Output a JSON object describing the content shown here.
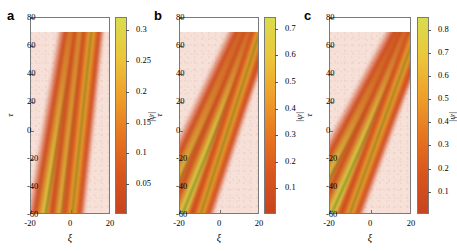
{
  "figure": {
    "background": "#ffffff",
    "plot_background": "#f6e0d8",
    "axis_color": "#7a7a7a"
  },
  "chart_data": [
    {
      "type": "heatmap",
      "panel": "a",
      "title": "",
      "xlabel": "ξ",
      "ylabel": "τ",
      "zlabel": "|ψ|",
      "xlim": [
        -20,
        20
      ],
      "ylim": [
        -60,
        80
      ],
      "xticks": [
        -20,
        0,
        20
      ],
      "yticks": [
        -60,
        -40,
        -20,
        0,
        20,
        40,
        60,
        80
      ],
      "xtick_labels": [
        "-20",
        "0",
        "20"
      ],
      "ytick_labels": [
        "-60",
        "-40",
        "-20",
        "0",
        "20",
        "40",
        "60",
        "80"
      ],
      "data_tau_max": 70,
      "zlim": [
        0.0,
        0.32
      ],
      "colorbar_ticks": [
        0.05,
        0.1,
        0.15,
        0.2,
        0.25,
        0.3
      ],
      "colorbar_tick_labels": [
        "0.05",
        "0.1",
        "0.15",
        "0.2",
        "0.25",
        "0.3"
      ],
      "grid": false,
      "legend": "none",
      "colormap": [
        "#c8441f",
        "#d9551d",
        "#e8761f",
        "#efa02a",
        "#ecc63a",
        "#d9dc4e"
      ],
      "soliton_tracks": [
        {
          "name": "track-1",
          "xi_at_tau0": -4.5,
          "slope_deg": 9.5,
          "width": 10,
          "peak": 0.3
        },
        {
          "name": "track-2",
          "xi_at_tau0": 1.5,
          "slope_deg": 7.0,
          "width": 9,
          "peak": 0.3
        },
        {
          "name": "track-3",
          "xi_at_tau0": 5.5,
          "slope_deg": 6.0,
          "width": 7,
          "peak": 0.22
        }
      ]
    },
    {
      "type": "heatmap",
      "panel": "b",
      "title": "",
      "xlabel": "ξ",
      "ylabel": "τ",
      "zlabel": "|ψ|",
      "xlim": [
        -20,
        20
      ],
      "ylim": [
        -60,
        80
      ],
      "xticks": [
        -20,
        0,
        20
      ],
      "yticks": [
        -60,
        -40,
        -20,
        0,
        20,
        40,
        60,
        80
      ],
      "xtick_labels": [
        "-20",
        "0",
        "20"
      ],
      "ytick_labels": [
        "-60",
        "-40",
        "-20",
        "0",
        "20",
        "40",
        "60",
        "80"
      ],
      "data_tau_max": 70,
      "zlim": [
        0.0,
        0.74
      ],
      "colorbar_ticks": [
        0.1,
        0.2,
        0.3,
        0.4,
        0.5,
        0.6,
        0.7
      ],
      "colorbar_tick_labels": [
        "0.1",
        "0.2",
        "0.3",
        "0.4",
        "0.5",
        "0.6",
        "0.7"
      ],
      "grid": false,
      "legend": "none",
      "colormap": [
        "#c8441f",
        "#d9551d",
        "#e8761f",
        "#efa02a",
        "#ecc63a",
        "#d9dc4e"
      ],
      "soliton_tracks": [
        {
          "name": "track-1",
          "xi_at_tau0": -5.0,
          "slope_deg": 25.0,
          "width": 11,
          "peak": 0.72
        },
        {
          "name": "track-2",
          "xi_at_tau0": 1.0,
          "slope_deg": 22.0,
          "width": 10,
          "peak": 0.72
        },
        {
          "name": "track-3",
          "xi_at_tau0": 6.0,
          "slope_deg": 18.0,
          "width": 7,
          "peak": 0.5
        }
      ]
    },
    {
      "type": "heatmap",
      "panel": "c",
      "title": "",
      "xlabel": "ξ",
      "ylabel": "τ",
      "zlabel": "|ψ|",
      "xlim": [
        -20,
        20
      ],
      "ylim": [
        -60,
        80
      ],
      "xticks": [
        -20,
        0,
        20
      ],
      "yticks": [
        -60,
        -40,
        -20,
        0,
        20,
        40,
        60,
        80
      ],
      "xtick_labels": [
        "-20",
        "0",
        "20"
      ],
      "ytick_labels": [
        "-60",
        "-40",
        "-20",
        "0",
        "20",
        "40",
        "60",
        "80"
      ],
      "data_tau_max": 70,
      "zlim": [
        0.0,
        0.85
      ],
      "colorbar_ticks": [
        0.1,
        0.2,
        0.3,
        0.4,
        0.5,
        0.6,
        0.7,
        0.8
      ],
      "colorbar_tick_labels": [
        "0.1",
        "0.2",
        "0.3",
        "0.4",
        "0.5",
        "0.6",
        "0.7",
        "0.8"
      ],
      "grid": false,
      "legend": "none",
      "colormap": [
        "#c8441f",
        "#d9551d",
        "#e8761f",
        "#efa02a",
        "#ecc63a",
        "#d9dc4e"
      ],
      "soliton_tracks": [
        {
          "name": "track-1",
          "xi_at_tau0": -4.0,
          "slope_deg": 28.0,
          "width": 11,
          "peak": 0.83
        },
        {
          "name": "track-2",
          "xi_at_tau0": 2.0,
          "slope_deg": 24.0,
          "width": 10,
          "peak": 0.83
        },
        {
          "name": "track-3",
          "xi_at_tau0": 7.0,
          "slope_deg": 20.0,
          "width": 7,
          "peak": 0.58
        }
      ]
    }
  ],
  "panels": [
    {
      "letter": "a"
    },
    {
      "letter": "b"
    },
    {
      "letter": "c"
    }
  ]
}
